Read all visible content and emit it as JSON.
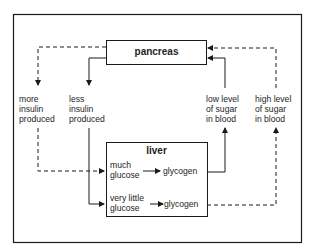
{
  "diagram": {
    "nodes": {
      "pancreas": {
        "label": "pancreas"
      },
      "liver": {
        "label": "liver"
      }
    },
    "labels": {
      "more_insulin": [
        "more",
        "insulin",
        "produced"
      ],
      "less_insulin": [
        "less",
        "insulin",
        "produced"
      ],
      "low_sugar": [
        "low level",
        "of sugar",
        "in blood"
      ],
      "high_sugar": [
        "high level",
        "of sugar",
        "in blood"
      ],
      "much_glucose": [
        "much",
        "glucose"
      ],
      "very_little_glucose": [
        "very little",
        "glucose"
      ],
      "glycogen_top": "glycogen",
      "glycogen_bottom": "glycogen"
    },
    "edges": [
      {
        "from": "pancreas",
        "to": "more insulin produced",
        "style": "dashed"
      },
      {
        "from": "pancreas",
        "to": "less insulin produced",
        "style": "solid"
      },
      {
        "from": "more insulin produced",
        "to": "much glucose",
        "style": "dashed"
      },
      {
        "from": "less insulin produced",
        "to": "very little glucose",
        "style": "solid"
      },
      {
        "from": "much glucose",
        "to": "glycogen",
        "style": "solid"
      },
      {
        "from": "very little glucose",
        "to": "glycogen",
        "style": "solid"
      },
      {
        "from": "glycogen (top)",
        "to": "low level of sugar in blood",
        "style": "solid"
      },
      {
        "from": "glycogen (bottom)",
        "to": "high level of sugar in blood",
        "style": "dashed"
      },
      {
        "from": "low level of sugar in blood",
        "to": "pancreas",
        "style": "solid"
      },
      {
        "from": "high level of sugar in blood",
        "to": "pancreas",
        "style": "dashed"
      }
    ],
    "colors": {
      "line": "#1a1a1a",
      "background": "#ffffff"
    }
  }
}
